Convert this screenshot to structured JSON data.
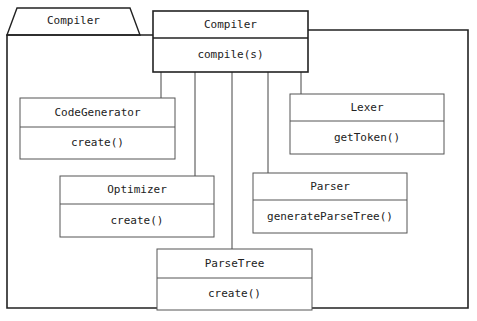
{
  "diagram": {
    "type": "UML class/package diagram",
    "package": {
      "name": "Compiler"
    },
    "facade": {
      "name": "Compiler",
      "operations": [
        "compile(s)"
      ]
    },
    "classes": [
      {
        "id": "codegenerator",
        "name": "CodeGenerator",
        "operations": [
          "create()"
        ]
      },
      {
        "id": "lexer",
        "name": "Lexer",
        "operations": [
          "getToken()"
        ]
      },
      {
        "id": "optimizer",
        "name": "Optimizer",
        "operations": [
          "create()"
        ]
      },
      {
        "id": "parser",
        "name": "Parser",
        "operations": [
          "generateParseTree()"
        ]
      },
      {
        "id": "parsetree",
        "name": "ParseTree",
        "operations": [
          "create()"
        ]
      }
    ],
    "associations": [
      {
        "from": "Compiler",
        "to": "CodeGenerator"
      },
      {
        "from": "Compiler",
        "to": "Optimizer"
      },
      {
        "from": "Compiler",
        "to": "ParseTree"
      },
      {
        "from": "Compiler",
        "to": "Parser"
      },
      {
        "from": "Compiler",
        "to": "Lexer"
      }
    ],
    "colors": {
      "line": "#222222",
      "background": "#ffffff"
    }
  }
}
